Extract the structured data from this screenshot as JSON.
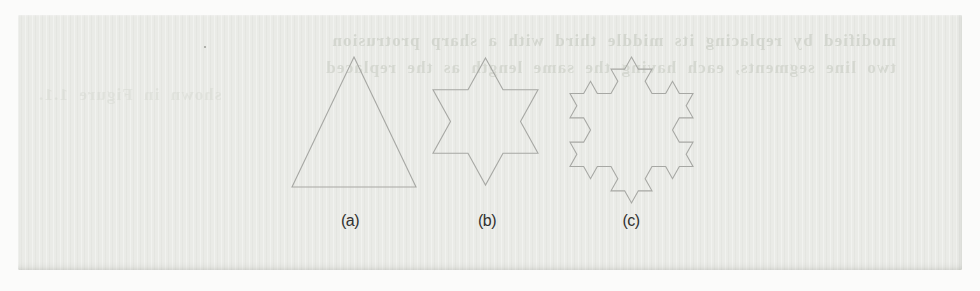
{
  "page": {
    "background_color": "#fbfbfa",
    "paper_color": "#eaebe7",
    "ghost_text_color": "#d0d3cb"
  },
  "ghost_text": {
    "note": "faint mirrored show-through text from the reverse side of the scanned page",
    "lines": [
      "modified by replacing its middle third with a sharp protrusion",
      "two line segments, each having the same length as the replaced",
      "shown in Figure 1.1."
    ]
  },
  "figure": {
    "stroke_color": "#a7a8a4",
    "label_color": "#31312f",
    "label_y": 212,
    "shapes": [
      {
        "id": "a",
        "label": "(a)",
        "shape_name": "equilateral-triangle-koch-iteration-0",
        "iterations": 0,
        "box": {
          "x": 292,
          "y": 57,
          "w": 124,
          "h": 130
        },
        "label_center_x": 350
      },
      {
        "id": "b",
        "label": "(b)",
        "shape_name": "six-pointed-star-koch-iteration-1",
        "iterations": 1,
        "box": {
          "x": 433,
          "y": 58,
          "w": 105,
          "h": 127
        },
        "label_center_x": 487
      },
      {
        "id": "c",
        "label": "(c)",
        "shape_name": "koch-snowflake-iteration-2",
        "iterations": 2,
        "box": {
          "x": 570,
          "y": 57,
          "w": 123,
          "h": 146
        },
        "label_center_x": 631
      }
    ]
  }
}
